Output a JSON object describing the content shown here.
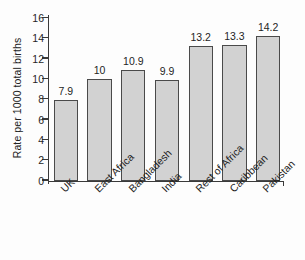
{
  "chart_data": {
    "type": "bar",
    "title": "",
    "subtitle": "",
    "xlabel": "",
    "ylabel": "Rate per 1000 total births",
    "categories": [
      "UK",
      "East Africa",
      "Bangladesh",
      "India",
      "Rest of Africa",
      "Caribbean",
      "Pakistan"
    ],
    "values": [
      7.9,
      10,
      10.9,
      9.9,
      13.2,
      13.3,
      14.2
    ],
    "value_labels": [
      "7.9",
      "10",
      "10.9",
      "9.9",
      "13.2",
      "13.3",
      "14.2"
    ],
    "ylim": [
      0,
      16
    ],
    "ytick_labels": [
      "0",
      "2",
      "4",
      "6",
      "8",
      "10",
      "12",
      "14",
      "16"
    ],
    "ytick_values": [
      0,
      2,
      4,
      6,
      8,
      10,
      12,
      14,
      16
    ],
    "grid": false,
    "legend": false,
    "legend_position": "none",
    "bar_fill_color": "#d2d2d2",
    "bar_edge_color": "#4a4a4a",
    "axis_color": "#3a3a3a",
    "text_color": "#1f1f1f",
    "background_color": "#fdfdfd",
    "xtick_label_rotation": -45
  }
}
